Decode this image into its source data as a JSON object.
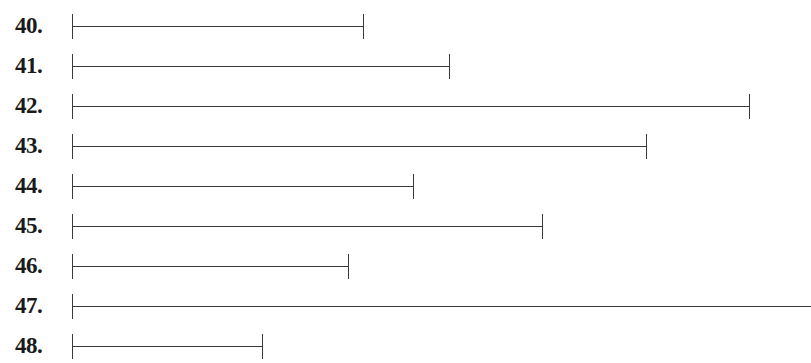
{
  "segments": [
    {
      "label": "40.",
      "y": 26,
      "start_x": 72,
      "end_x": 363,
      "end_visible": true
    },
    {
      "label": "41.",
      "y": 66,
      "start_x": 72,
      "end_x": 449,
      "end_visible": true
    },
    {
      "label": "42.",
      "y": 106,
      "start_x": 72,
      "end_x": 749,
      "end_visible": true
    },
    {
      "label": "43.",
      "y": 146,
      "start_x": 72,
      "end_x": 646,
      "end_visible": true
    },
    {
      "label": "44.",
      "y": 186,
      "start_x": 72,
      "end_x": 413,
      "end_visible": true
    },
    {
      "label": "45.",
      "y": 226,
      "start_x": 72,
      "end_x": 542,
      "end_visible": true
    },
    {
      "label": "46.",
      "y": 266,
      "start_x": 72,
      "end_x": 348,
      "end_visible": true
    },
    {
      "label": "47.",
      "y": 306,
      "start_x": 72,
      "end_x": 811,
      "end_visible": false
    },
    {
      "label": "48.",
      "y": 346,
      "start_x": 72,
      "end_x": 262,
      "end_visible": true
    }
  ],
  "colors": {
    "line": "#3a3a3a",
    "text": "#1a1a1a",
    "background": "#ffffff"
  }
}
